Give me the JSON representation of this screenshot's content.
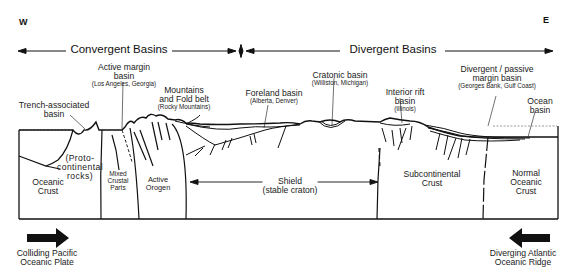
{
  "compass": {
    "west": "W",
    "east": "E"
  },
  "bands": {
    "convergent": "Convergent Basins",
    "divergent": "Divergent Basins"
  },
  "labels": {
    "trench_basin": {
      "main": "Trench-associated basin",
      "line1": "Trench-associated",
      "line2": "basin"
    },
    "active_margin": {
      "line1": "Active margin",
      "line2": "basin",
      "example": "(Los Angeles, Georgia)"
    },
    "mountains": {
      "line1": "Mountains",
      "line2": "and Fold belt",
      "example": "(Rocky Mountains)"
    },
    "foreland": {
      "line1": "Foreland basin",
      "example": "(Alberta, Denver)"
    },
    "cratonic": {
      "line1": "Cratonic basin",
      "example": "(Williston, Michigan)"
    },
    "interior_rift": {
      "line1": "Interior rift",
      "line2": "basin",
      "example": "(Illinois)"
    },
    "passive_margin": {
      "line1": "Divergent / passive",
      "line2": "margin basin",
      "example": "(Georges Bank, Gulf Coast)"
    },
    "ocean_basin": {
      "line1": "Ocean",
      "line2": "basin"
    }
  },
  "crust_regions": {
    "oceanic": {
      "line1": "Oceanic",
      "line2": "Crust"
    },
    "proto": {
      "line1": "(Proto-",
      "line2": "continental",
      "line3": "rocks)"
    },
    "mixed": {
      "line1": "Mixed",
      "line2": "Crustal",
      "line3": "Parts"
    },
    "orogen": {
      "line1": "Active",
      "line2": "Orogen"
    },
    "shield": {
      "line1": "Shield",
      "line2": "(stable craton)"
    },
    "subcontinental": {
      "line1": "Subcontinental",
      "line2": "Crust"
    },
    "normal_oceanic": {
      "line1": "Normal",
      "line2": "Oceanic",
      "line3": "Crust"
    }
  },
  "plates": {
    "left": {
      "line1": "Colliding Pacific",
      "line2": "Oceanic Plate",
      "direction": "east"
    },
    "right": {
      "line1": "Diverging Atlantic",
      "line2": "Oceanic Ridge",
      "direction": "west"
    }
  }
}
